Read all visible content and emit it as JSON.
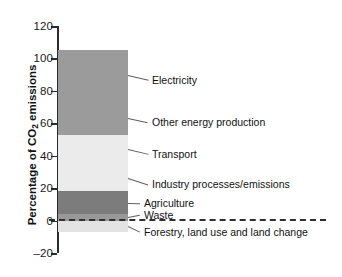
{
  "chart_data": {
    "type": "bar",
    "title": "",
    "xlabel": "",
    "ylabel": "Percentage of CO2 emissions",
    "ylabel_prefix": "Percentage of CO",
    "ylabel_sub": "2",
    "ylabel_suffix": " emissions",
    "ylim": [
      -20,
      120
    ],
    "grid": false,
    "legend": "inline-leader-labels",
    "stacked": true,
    "categories": [
      "Global CO2 emissions by sector"
    ],
    "tick_labels": [
      "120",
      "100",
      "80",
      "60",
      "40",
      "20",
      "0",
      "–20"
    ],
    "tick_values": [
      120,
      100,
      80,
      60,
      40,
      20,
      0,
      -20
    ],
    "segments": [
      {
        "name": "Electricity",
        "value": 31,
        "start": 74,
        "end": 105,
        "color": "#9b9b9b"
      },
      {
        "name": "Other energy production",
        "value": 21,
        "start": 53,
        "end": 74,
        "color": "#9b9b9b"
      },
      {
        "name": "Transport",
        "value": 18,
        "start": 35,
        "end": 53,
        "color": "#ebebeb"
      },
      {
        "name": "Industry processes/emissions",
        "value": 17,
        "start": 18,
        "end": 35,
        "color": "#ebebeb"
      },
      {
        "name": "Agriculture",
        "value": 14,
        "start": 4,
        "end": 18,
        "color": "#7c7c7c"
      },
      {
        "name": "Waste",
        "value": 4,
        "start": 0,
        "end": 4,
        "color": "#989898"
      },
      {
        "name": "Forestry, land use and land change",
        "value": -7,
        "start": -7,
        "end": 0,
        "color": "#e3e3e3"
      }
    ],
    "labels": [
      {
        "text": "Electricity",
        "y": 80
      },
      {
        "text": "Other energy production",
        "y": 122
      },
      {
        "text": "Transport",
        "y": 154
      },
      {
        "text": "Industry processes/emissions",
        "y": 184
      },
      {
        "text": "Agriculture",
        "y": 203
      },
      {
        "text": "Waste",
        "y": 215
      },
      {
        "text": "Forestry, land use and land change",
        "y": 232
      }
    ]
  },
  "credit": {
    "text": ""
  }
}
